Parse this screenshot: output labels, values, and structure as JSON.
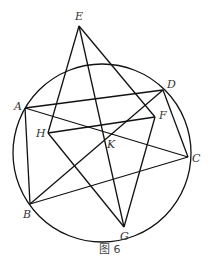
{
  "figure": {
    "caption": "图 6",
    "circle": {
      "cx": 102,
      "cy": 153,
      "r": 89
    },
    "points": {
      "A": {
        "label": "A",
        "x": 25,
        "y": 108
      },
      "B": {
        "label": "B",
        "x": 30,
        "y": 204
      },
      "C": {
        "label": "C",
        "x": 188,
        "y": 157
      },
      "D": {
        "label": "D",
        "x": 163,
        "y": 90
      },
      "E": {
        "label": "E",
        "x": 79,
        "y": 26
      },
      "F": {
        "label": "F",
        "x": 155,
        "y": 117
      },
      "G": {
        "label": "G",
        "x": 124,
        "y": 227
      },
      "H": {
        "label": "H",
        "x": 48,
        "y": 133
      },
      "K": {
        "label": "K",
        "x": 110,
        "y": 136
      }
    },
    "segments": [
      [
        "E",
        "H"
      ],
      [
        "E",
        "G"
      ],
      [
        "E",
        "F"
      ],
      [
        "A",
        "D"
      ],
      [
        "A",
        "C"
      ],
      [
        "A",
        "B"
      ],
      [
        "D",
        "B"
      ],
      [
        "D",
        "C"
      ],
      [
        "H",
        "F"
      ],
      [
        "H",
        "G"
      ],
      [
        "F",
        "G"
      ],
      [
        "B",
        "C"
      ]
    ]
  }
}
